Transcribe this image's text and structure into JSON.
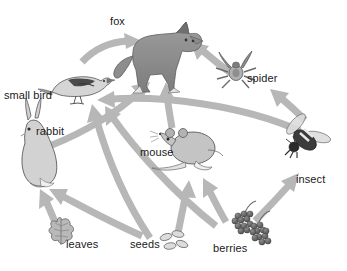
{
  "diagram": {
    "kind": "food-web",
    "title": "",
    "background_color": "#ffffff",
    "arrow_color": "#b7b7b7",
    "arrow_color_dark": "#a8a8a8",
    "label_color": "#1a1a1a",
    "organism_fill": "#c9c9c9",
    "organism_stroke": "#6e6e6e"
  },
  "nodes": {
    "fox": {
      "label": "fox",
      "label_x": 110,
      "label_y": 16,
      "trophic": "predator"
    },
    "small_bird": {
      "label": "small bird",
      "label_x": 4,
      "label_y": 90,
      "trophic": "consumer"
    },
    "spider": {
      "label": "spider",
      "label_x": 247,
      "label_y": 73,
      "trophic": "consumer"
    },
    "rabbit": {
      "label": "rabbit",
      "label_x": 36,
      "label_y": 126,
      "trophic": "herbivore"
    },
    "mouse": {
      "label": "mouse",
      "label_x": 140,
      "label_y": 147,
      "trophic": "herbivore"
    },
    "insect": {
      "label": "insect",
      "label_x": 296,
      "label_y": 174,
      "trophic": "consumer"
    },
    "leaves": {
      "label": "leaves",
      "label_x": 66,
      "label_y": 239,
      "trophic": "producer"
    },
    "seeds": {
      "label": "seeds",
      "label_x": 130,
      "label_y": 239,
      "trophic": "producer"
    },
    "berries": {
      "label": "berries",
      "label_x": 213,
      "label_y": 243,
      "trophic": "producer"
    }
  },
  "links": [
    {
      "from": "small_bird",
      "to": "fox",
      "label": "small bird eaten by fox"
    },
    {
      "from": "spider",
      "to": "fox",
      "label": "spider eaten by fox"
    },
    {
      "from": "rabbit",
      "to": "fox",
      "label": "rabbit eaten by fox"
    },
    {
      "from": "mouse",
      "to": "fox",
      "label": "mouse eaten by fox"
    },
    {
      "from": "insect",
      "to": "spider",
      "label": "insect eaten by spider"
    },
    {
      "from": "insect",
      "to": "small_bird",
      "label": "insect eaten by small bird"
    },
    {
      "from": "seeds",
      "to": "small_bird",
      "label": "seeds eaten by small bird"
    },
    {
      "from": "berries",
      "to": "small_bird",
      "label": "berries eaten by small bird"
    },
    {
      "from": "leaves",
      "to": "rabbit",
      "label": "leaves eaten by rabbit"
    },
    {
      "from": "seeds",
      "to": "rabbit",
      "label": "seeds eaten by rabbit"
    },
    {
      "from": "seeds",
      "to": "mouse",
      "label": "seeds eaten by mouse"
    },
    {
      "from": "berries",
      "to": "mouse",
      "label": "berries eaten by mouse"
    },
    {
      "from": "berries",
      "to": "insect",
      "label": "berries eaten by insect"
    }
  ]
}
